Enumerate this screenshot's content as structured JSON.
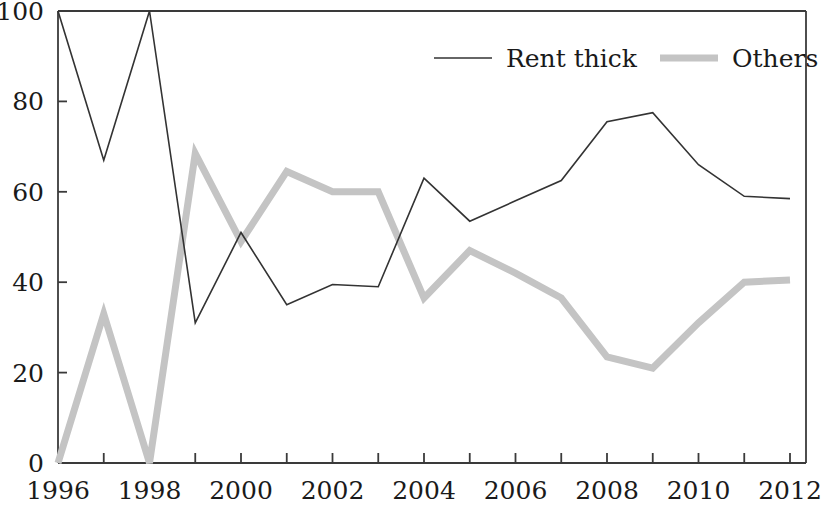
{
  "chart_data": {
    "type": "line",
    "title": "",
    "subtitle": "",
    "xlabel": "",
    "ylabel": "",
    "x": [
      1996,
      1997,
      1998,
      1999,
      2000,
      2001,
      2002,
      2003,
      2004,
      2005,
      2006,
      2007,
      2008,
      2009,
      2010,
      2011,
      2012
    ],
    "xlim": [
      1996,
      2012
    ],
    "ylim": [
      0,
      100
    ],
    "xtick_labels": [
      "1996",
      "1998",
      "2000",
      "2002",
      "2004",
      "2006",
      "2008",
      "2010",
      "2012"
    ],
    "xtick_values": [
      1996,
      1998,
      2000,
      2002,
      2004,
      2006,
      2008,
      2010,
      2012
    ],
    "xtick_minor_values": [
      1997,
      1999,
      2001,
      2003,
      2005,
      2007,
      2009,
      2011
    ],
    "ytick_labels": [
      "0",
      "20",
      "40",
      "60",
      "80",
      "100"
    ],
    "ytick_values": [
      0,
      20,
      40,
      60,
      80,
      100
    ],
    "grid": false,
    "legend_position": "top-right",
    "series": [
      {
        "name": "Rent thick",
        "color": "#333333",
        "line_width": 1.6,
        "style": "thin-solid",
        "values": [
          100,
          67,
          100,
          31,
          51,
          35,
          39.5,
          39,
          63,
          53.5,
          58,
          62.5,
          75.5,
          77.5,
          66,
          59,
          58.5
        ]
      },
      {
        "name": "Others",
        "color": "#c4c4c4",
        "line_width": 7,
        "style": "thick-solid",
        "values": [
          0,
          33,
          0,
          68.5,
          49,
          64.5,
          60,
          60,
          36.5,
          47,
          42,
          36.5,
          23.5,
          21,
          31,
          40,
          40.5
        ]
      }
    ]
  },
  "legend": {
    "items": [
      {
        "label": "Rent thick",
        "swatch": "thin-line-swatch"
      },
      {
        "label": "Others",
        "swatch": "thick-line-swatch"
      }
    ]
  },
  "axes": {
    "left_axis_name": "y-axis",
    "bottom_axis_name": "x-axis",
    "axis_color": "#3a3a3a"
  }
}
